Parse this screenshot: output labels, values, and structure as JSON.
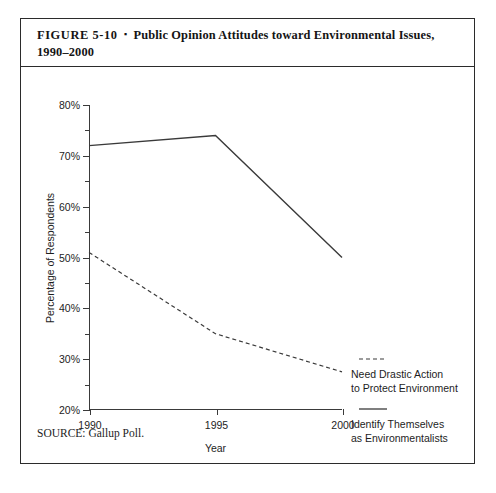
{
  "figure": {
    "label": "FIGURE  5-10",
    "bullet": "▪",
    "title_line1": "Public Opinion Attitudes toward Environmental Issues,",
    "title_line2": "1990–2000",
    "source": "SOURCE: Gallup Poll."
  },
  "legend": {
    "dashed": {
      "line1": "Need Drastic Action",
      "line2": "to Protect Environment"
    },
    "solid": {
      "line1": "Identify Themselves",
      "line2": "as Environmentalists"
    }
  },
  "chart_data": {
    "type": "line",
    "title": "Public Opinion Attitudes toward Environmental Issues, 1990–2000",
    "xlabel": "Year",
    "ylabel": "Percentage of Respondents",
    "x": [
      1990,
      1995,
      2000
    ],
    "xtick_labels": [
      "1990",
      "1995",
      "2000"
    ],
    "xlim": [
      1990,
      2000
    ],
    "ylim": [
      20,
      80
    ],
    "ytick_labels": [
      "20%",
      "30%",
      "40%",
      "50%",
      "60%",
      "70%",
      "80%"
    ],
    "ytick_values": [
      20,
      30,
      40,
      50,
      60,
      70,
      80
    ],
    "yminor_values": [
      25,
      35,
      45,
      55,
      65,
      75
    ],
    "grid": false,
    "legend_position": "right",
    "series": [
      {
        "name": "Identify Themselves as Environmentalists",
        "style": "solid",
        "color": "#3a3a3a",
        "values": [
          72,
          74,
          50
        ]
      },
      {
        "name": "Need Drastic Action to Protect Environment",
        "style": "dashed",
        "color": "#3a3a3a",
        "values": [
          51,
          35,
          27.5
        ]
      }
    ]
  }
}
